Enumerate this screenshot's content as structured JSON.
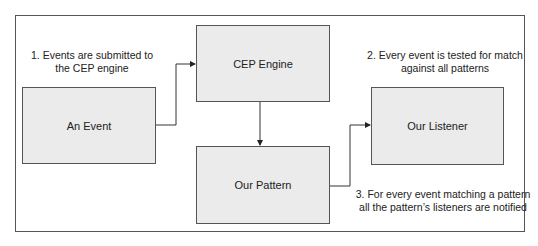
{
  "diagram": {
    "nodes": [
      {
        "id": "event",
        "label": "An Event"
      },
      {
        "id": "engine",
        "label": "CEP Engine"
      },
      {
        "id": "pattern",
        "label": "Our Pattern"
      },
      {
        "id": "listener",
        "label": "Our Listener"
      }
    ],
    "edges": [
      {
        "from": "event",
        "to": "engine"
      },
      {
        "from": "engine",
        "to": "pattern"
      },
      {
        "from": "pattern",
        "to": "listener"
      }
    ],
    "notes": [
      {
        "line1": "1. Events are submitted to",
        "line2": "the CEP engine"
      },
      {
        "line1": "2. Every event is tested for match",
        "line2": "against all patterns"
      },
      {
        "line1": "3. For every event matching a pattern",
        "line2": "all the pattern’s listeners are notified"
      }
    ]
  }
}
